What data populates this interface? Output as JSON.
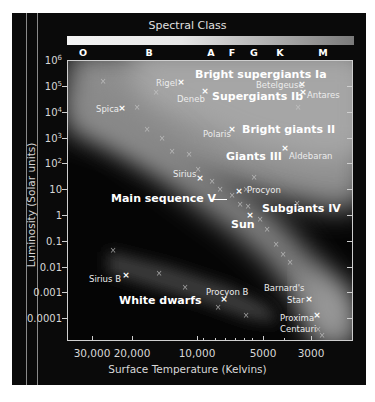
{
  "chart_data": {
    "type": "scatter",
    "title": "Spectral Class",
    "xlabel": "Surface Temperature (Kelvins)",
    "ylabel": "Luminosity (Solar units)",
    "x_scale": "log, reversed",
    "y_scale": "log",
    "xlim": [
      40000,
      2500
    ],
    "ylim": [
      1e-05,
      1000000
    ],
    "grid": false,
    "spectral_classes": [
      "O",
      "B",
      "A",
      "F",
      "G",
      "K",
      "M"
    ],
    "x_tick_labels": [
      "30,000",
      "20,000",
      "10,000",
      "5000",
      "3000"
    ],
    "y_tick_labels": [
      "10^6",
      "10^5",
      "10^4",
      "10^3",
      "10^2",
      "10",
      "1",
      "0.1",
      "0.01",
      "0.001",
      "0.0001"
    ],
    "named_stars": [
      {
        "name": "Rigel",
        "temperature": 12000,
        "luminosity": 100000
      },
      {
        "name": "Deneb",
        "temperature": 9000,
        "luminosity": 60000
      },
      {
        "name": "Betelgeuse",
        "temperature": 3500,
        "luminosity": 100000
      },
      {
        "name": "Antares",
        "temperature": 3400,
        "luminosity": 50000
      },
      {
        "name": "Spica",
        "temperature": 24000,
        "luminosity": 12000
      },
      {
        "name": "Polaris",
        "temperature": 6500,
        "luminosity": 2000
      },
      {
        "name": "Aldebaran",
        "temperature": 4000,
        "luminosity": 400
      },
      {
        "name": "Sirius",
        "temperature": 9800,
        "luminosity": 25
      },
      {
        "name": "Procyon",
        "temperature": 6500,
        "luminosity": 7
      },
      {
        "name": "Sun",
        "temperature": 5800,
        "luminosity": 1
      },
      {
        "name": "Sirius B",
        "temperature": 25000,
        "luminosity": 0.005
      },
      {
        "name": "Procyon B",
        "temperature": 8000,
        "luminosity": 0.0005
      },
      {
        "name": "Barnard's Star",
        "temperature": 3100,
        "luminosity": 0.0004
      },
      {
        "name": "Proxima Centauri",
        "temperature": 2900,
        "luminosity": 0.0001
      }
    ],
    "regions": [
      "Bright supergiants Ia",
      "Supergiants Ib",
      "Bright giants II",
      "Giants III",
      "Subgiants IV",
      "Main sequence V",
      "White dwarfs"
    ]
  },
  "figure": {
    "title": "Spectral Class",
    "xlabel": "Surface Temperature (Kelvins)",
    "ylabel": "Luminosity (Solar units)",
    "spectral": [
      {
        "label": "O",
        "x": 83
      },
      {
        "label": "B",
        "x": 149
      },
      {
        "label": "A",
        "x": 211
      },
      {
        "label": "F",
        "x": 232
      },
      {
        "label": "G",
        "x": 254
      },
      {
        "label": "K",
        "x": 280
      },
      {
        "label": "M",
        "x": 323
      }
    ],
    "yticks": [
      {
        "base": "10",
        "exp": "6",
        "y": 60
      },
      {
        "base": "10",
        "exp": "5",
        "y": 86
      },
      {
        "base": "10",
        "exp": "4",
        "y": 112
      },
      {
        "base": "10",
        "exp": "3",
        "y": 138
      },
      {
        "base": "10",
        "exp": "2",
        "y": 163
      },
      {
        "base": "10",
        "exp": "",
        "y": 189
      },
      {
        "base": "1",
        "exp": "",
        "y": 215
      },
      {
        "base": "0.1",
        "exp": "",
        "y": 241
      },
      {
        "base": "0.01",
        "exp": "",
        "y": 267
      },
      {
        "base": "0.001",
        "exp": "",
        "y": 292
      },
      {
        "base": "0.0001",
        "exp": "",
        "y": 318
      }
    ],
    "xticks": [
      {
        "label": "30,000",
        "x": 92
      },
      {
        "label": "20,000",
        "x": 132
      },
      {
        "label": "10,000",
        "x": 197
      },
      {
        "label": "5000",
        "x": 263
      },
      {
        "label": "3000",
        "x": 311
      }
    ],
    "region_labels": [
      {
        "text": "Bright supergiants Ia",
        "x": 195,
        "y": 69
      },
      {
        "text": "Supergiants Ib",
        "x": 212,
        "y": 91
      },
      {
        "text": "Bright giants II",
        "x": 242,
        "y": 124
      },
      {
        "text": "Giants III",
        "x": 226,
        "y": 151
      },
      {
        "text": "Main sequence V",
        "x": 111,
        "y": 193
      },
      {
        "text": "Subgiants IV",
        "x": 262,
        "y": 203
      },
      {
        "text": "Sun",
        "x": 231,
        "y": 219
      },
      {
        "text": "White dwarfs",
        "x": 119,
        "y": 295
      }
    ],
    "star_labels": [
      {
        "text": "Rigel",
        "x": 156,
        "y": 79
      },
      {
        "text": "Deneb",
        "x": 177,
        "y": 95
      },
      {
        "text": "Betelgeuse",
        "x": 256,
        "y": 81
      },
      {
        "text": "Antares",
        "x": 307,
        "y": 91
      },
      {
        "text": "Spica",
        "x": 96,
        "y": 105
      },
      {
        "text": "Polaris",
        "x": 203,
        "y": 130
      },
      {
        "text": "Aldebaran",
        "x": 289,
        "y": 152
      },
      {
        "text": "Sirius",
        "x": 173,
        "y": 170
      },
      {
        "text": "Procyon",
        "x": 247,
        "y": 186
      },
      {
        "text": "Sirius B",
        "x": 89,
        "y": 275
      },
      {
        "text": "Procyon B",
        "x": 206,
        "y": 288
      },
      {
        "text": "Barnard's",
        "x": 264,
        "y": 284
      },
      {
        "text": "Star",
        "x": 287,
        "y": 296
      },
      {
        "text": "Proxima",
        "x": 280,
        "y": 314
      },
      {
        "text": "Centauri",
        "x": 280,
        "y": 325
      }
    ],
    "stars_bright": [
      {
        "x": 181,
        "y": 82
      },
      {
        "x": 205,
        "y": 91
      },
      {
        "x": 302,
        "y": 84
      },
      {
        "x": 303,
        "y": 92
      },
      {
        "x": 122,
        "y": 108
      },
      {
        "x": 232,
        "y": 129
      },
      {
        "x": 285,
        "y": 148
      },
      {
        "x": 200,
        "y": 178
      },
      {
        "x": 239,
        "y": 191
      },
      {
        "x": 250,
        "y": 215
      },
      {
        "x": 126,
        "y": 275
      },
      {
        "x": 224,
        "y": 299
      },
      {
        "x": 309,
        "y": 299
      },
      {
        "x": 317,
        "y": 315
      }
    ],
    "stars_faint": [
      {
        "x": 103,
        "y": 82
      },
      {
        "x": 156,
        "y": 93
      },
      {
        "x": 137,
        "y": 108
      },
      {
        "x": 147,
        "y": 130
      },
      {
        "x": 162,
        "y": 139
      },
      {
        "x": 172,
        "y": 152
      },
      {
        "x": 189,
        "y": 155
      },
      {
        "x": 198,
        "y": 170
      },
      {
        "x": 212,
        "y": 182
      },
      {
        "x": 220,
        "y": 190
      },
      {
        "x": 232,
        "y": 196
      },
      {
        "x": 240,
        "y": 205
      },
      {
        "x": 248,
        "y": 207
      },
      {
        "x": 260,
        "y": 220
      },
      {
        "x": 267,
        "y": 230
      },
      {
        "x": 276,
        "y": 245
      },
      {
        "x": 283,
        "y": 255
      },
      {
        "x": 290,
        "y": 263
      },
      {
        "x": 254,
        "y": 178
      },
      {
        "x": 297,
        "y": 204
      },
      {
        "x": 246,
        "y": 190
      },
      {
        "x": 298,
        "y": 108
      },
      {
        "x": 113,
        "y": 251
      },
      {
        "x": 159,
        "y": 274
      },
      {
        "x": 185,
        "y": 288
      },
      {
        "x": 218,
        "y": 308
      },
      {
        "x": 246,
        "y": 316
      },
      {
        "x": 318,
        "y": 330
      },
      {
        "x": 322,
        "y": 336
      }
    ]
  }
}
